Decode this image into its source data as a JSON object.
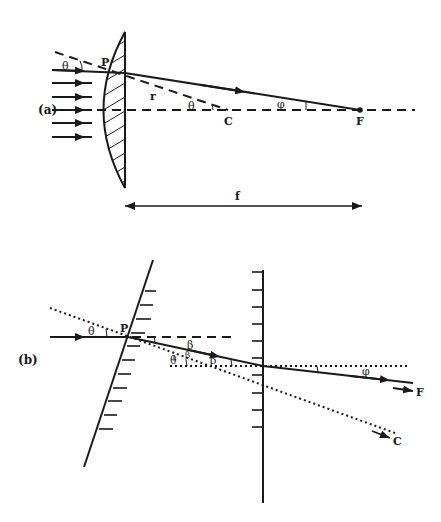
{
  "figure": {
    "panel_a": {
      "label": "(a)",
      "point_P": "P",
      "center_C": "C",
      "focus_F": "F",
      "radius_r": "r",
      "angle_theta_incident": "θ",
      "angle_theta_center": "θ",
      "angle_phi": "φ",
      "focal_length": "f",
      "incoming_ray_count": 6
    },
    "panel_b": {
      "label": "(b)",
      "point_P": "P",
      "angle_theta_incident": "θ",
      "angle_theta_lower": "θ",
      "angle_beta_upper": "β",
      "angle_beta_mid": "β",
      "angle_beta_lower": "β",
      "angle_phi": "φ",
      "focus_F": "F",
      "center_C": "C"
    }
  },
  "colors": {
    "ink": "#1a1a1a",
    "background": "#ffffff"
  }
}
